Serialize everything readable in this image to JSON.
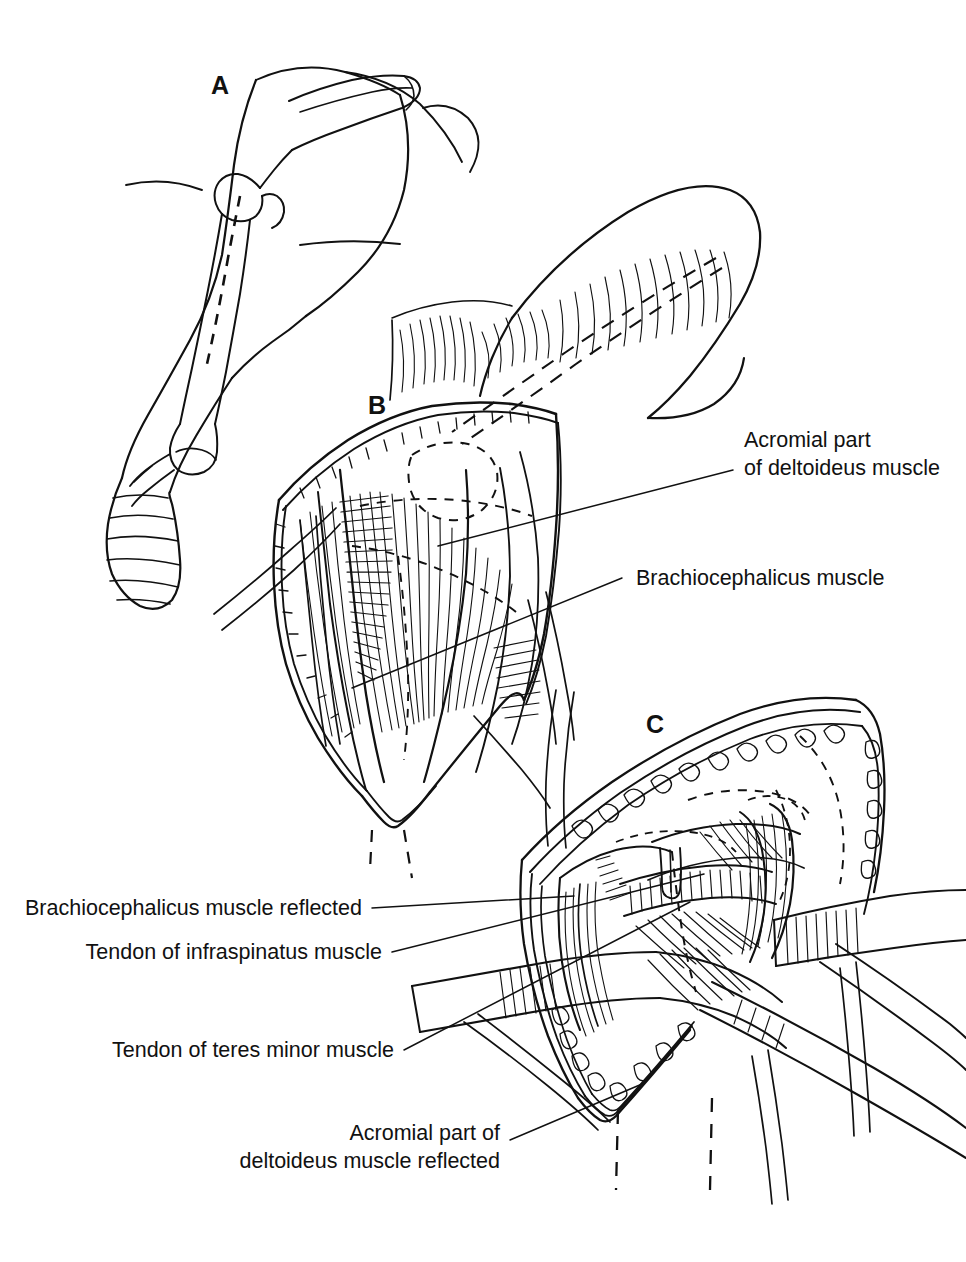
{
  "figure": {
    "kind": "anatomical-line-illustration",
    "background_color": "#ffffff",
    "ink_color": "#111111",
    "width": 966,
    "height": 1262
  },
  "panels": [
    {
      "id": "A",
      "letter": "A",
      "caption": "",
      "description": "Lateral view of the forelimb with scapula, humerus and radius-ulna outlined; dashed line marks the planned skin incision over the humerus"
    },
    {
      "id": "B",
      "letter": "B",
      "caption": "",
      "description": "Skin incised and retracted exposing the acromial part of the deltoideus and the brachiocephalicus muscles"
    },
    {
      "id": "C",
      "letter": "C",
      "caption": "",
      "description": "Deep dissection with retractors; brachiocephalicus and acromial deltoideus reflected, tendons of infraspinatus and teres minor exposed"
    }
  ],
  "labels": [
    {
      "id": "acromial-deltoideus",
      "lines": [
        "Acromial part",
        "of deltoideus muscle"
      ],
      "align": "left",
      "panel": "B"
    },
    {
      "id": "brachiocephalicus",
      "lines": [
        "Brachiocephalicus muscle"
      ],
      "align": "left",
      "panel": "B"
    },
    {
      "id": "brachiocephalicus-reflected",
      "lines": [
        "Brachiocephalicus muscle reflected"
      ],
      "align": "right",
      "panel": "C"
    },
    {
      "id": "tendon-infraspinatus",
      "lines": [
        "Tendon of infraspinatus muscle"
      ],
      "align": "right",
      "panel": "C"
    },
    {
      "id": "tendon-teres-minor",
      "lines": [
        "Tendon of teres minor muscle"
      ],
      "align": "right",
      "panel": "C"
    },
    {
      "id": "acromial-deltoideus-reflected",
      "lines": [
        "Acromial part of",
        "deltoideus muscle reflected"
      ],
      "align": "right",
      "panel": "C"
    }
  ]
}
